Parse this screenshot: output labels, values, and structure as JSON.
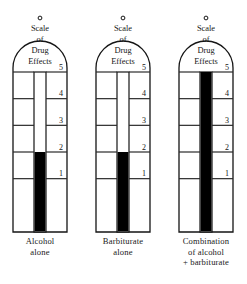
{
  "figure": {
    "title_lines": [
      "Scale",
      "of",
      "Drug",
      "Effects"
    ],
    "levels": [
      "5",
      "4",
      "3",
      "2",
      "1"
    ],
    "vent_marker": "vent-hole"
  },
  "gauges": [
    {
      "id": "alcohol-alone",
      "caption_lines": [
        "Alcohol",
        "alone"
      ],
      "fill_level_label": "2",
      "fill_from_level": 2,
      "fill_color": "#000000"
    },
    {
      "id": "barbiturate-alone",
      "caption_lines": [
        "Barbiturate",
        "alone"
      ],
      "fill_level_label": "2",
      "fill_from_level": 2,
      "fill_color": "#000000"
    },
    {
      "id": "combination-alcohol-barbiturate",
      "caption_lines": [
        "Combination",
        "of alcohol",
        "+ barbiturate"
      ],
      "fill_level_label": "5",
      "fill_from_level": 5,
      "fill_color": "#000000"
    }
  ],
  "chart_data": {
    "type": "bar",
    "xlabel": "",
    "ylabel": "Scale of Drug Effects",
    "categories": [
      "Alcohol alone",
      "Barbiturate alone",
      "Combination of alcohol + barbiturate"
    ],
    "values": [
      2,
      2,
      5
    ],
    "ylim": [
      0,
      5
    ],
    "tick_labels": [
      "1",
      "2",
      "3",
      "4",
      "5"
    ],
    "grid": true,
    "legend": "none"
  },
  "colors": {
    "ink": "#151515",
    "fill": "#000000",
    "background": "#ffffff",
    "rule": "#2a2a2a"
  }
}
